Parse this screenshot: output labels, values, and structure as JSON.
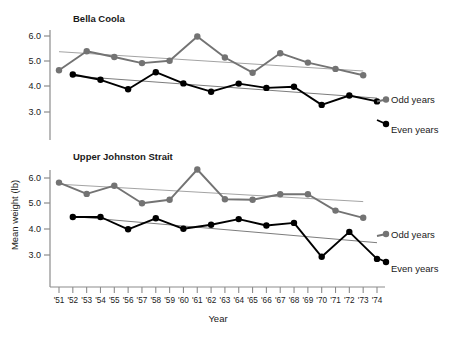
{
  "figure": {
    "width": 464,
    "height": 338,
    "background": "#ffffff",
    "ylabel": "Mean weight (lb)",
    "xlabel": "Year",
    "odd_color": "#737373",
    "even_color": "#000000",
    "trend_color": "#8c8c8c",
    "axis_color": "#8c8c8c"
  },
  "chart_data": {
    "type": "line",
    "title": "",
    "xlabel": "Year",
    "ylabel": "Mean weight (lb)",
    "grid": false,
    "legend_position": "right",
    "x": [
      1951,
      1952,
      1953,
      1954,
      1955,
      1956,
      1957,
      1958,
      1959,
      1960,
      1961,
      1962,
      1963,
      1964,
      1965,
      1966,
      1967,
      1968,
      1969,
      1970,
      1971,
      1972,
      1973,
      1974
    ],
    "tick_labels": [
      "'51",
      "'52",
      "'53",
      "'54",
      "'55",
      "'56",
      "'57",
      "'58",
      "'59",
      "'60",
      "'61",
      "'62",
      "'63",
      "'64",
      "'65",
      "'66",
      "'67",
      "'68",
      "'69",
      "'70",
      "'71",
      "'72",
      "'73",
      "'74"
    ],
    "panels": [
      {
        "name": "Bella Coola",
        "ylim": [
          2.5,
          6.3
        ],
        "yticks": [
          3.0,
          4.0,
          5.0,
          6.0
        ],
        "ytick_labels": [
          "3.0",
          "4.0",
          "5.0",
          "6.0"
        ],
        "series": [
          {
            "name": "Odd years",
            "color": "#737373",
            "x": [
              1951,
              1953,
              1955,
              1957,
              1959,
              1961,
              1963,
              1965,
              1967,
              1969,
              1971,
              1973
            ],
            "values": [
              4.65,
              5.4,
              5.17,
              4.93,
              5.02,
              5.98,
              5.15,
              4.55,
              5.32,
              4.95,
              4.7,
              4.45
            ],
            "trend": {
              "x0": 1951,
              "y0": 5.38,
              "x1": 1973,
              "y1": 4.62
            }
          },
          {
            "name": "Even years",
            "color": "#000000",
            "x": [
              1952,
              1954,
              1956,
              1958,
              1960,
              1962,
              1964,
              1966,
              1968,
              1970,
              1972,
              1974
            ],
            "values": [
              4.48,
              4.27,
              3.9,
              4.57,
              4.13,
              3.8,
              4.12,
              3.95,
              4.0,
              3.28,
              3.65,
              3.42
            ],
            "trend": {
              "x0": 1952,
              "y0": 4.42,
              "x1": 1974,
              "y1": 3.55
            }
          }
        ]
      },
      {
        "name": "Upper Johnston Strait",
        "ylim": [
          2.5,
          6.5
        ],
        "yticks": [
          3.0,
          4.0,
          5.0,
          6.0
        ],
        "ytick_labels": [
          "3.0",
          "4.0",
          "5.0",
          "6.0"
        ],
        "series": [
          {
            "name": "Odd years",
            "color": "#737373",
            "x": [
              1951,
              1953,
              1955,
              1957,
              1959,
              1961,
              1963,
              1965,
              1967,
              1969,
              1971,
              1973
            ],
            "values": [
              5.82,
              5.38,
              5.7,
              5.02,
              5.15,
              6.33,
              5.17,
              5.15,
              5.37,
              5.37,
              4.73,
              4.45
            ],
            "trend": {
              "x0": 1951,
              "y0": 5.76,
              "x1": 1973,
              "y1": 5.08
            }
          },
          {
            "name": "Even years",
            "color": "#000000",
            "x": [
              1952,
              1954,
              1956,
              1958,
              1960,
              1962,
              1964,
              1966,
              1968,
              1970,
              1972,
              1974
            ],
            "values": [
              4.48,
              4.48,
              4.0,
              4.43,
              4.02,
              4.18,
              4.4,
              4.15,
              4.25,
              2.93,
              3.9,
              2.85,
              3.4
            ],
            "trend": {
              "x0": 1952,
              "y0": 4.5,
              "x1": 1974,
              "y1": 3.48
            }
          }
        ]
      }
    ]
  },
  "legend": {
    "odd_label": "Odd years",
    "even_label": "Even years"
  },
  "panel_titles": {
    "top": "Bella Coola",
    "bottom": "Upper Johnston Strait"
  }
}
